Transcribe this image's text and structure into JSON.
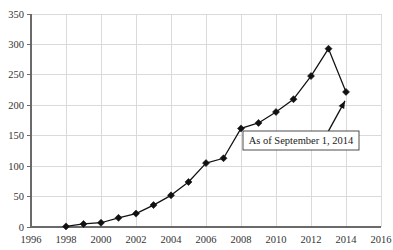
{
  "chart_data": {
    "type": "line",
    "title": "",
    "xlabel": "",
    "ylabel": "",
    "xlim": [
      1996,
      2016
    ],
    "ylim": [
      0,
      350
    ],
    "grid": true,
    "legend": "none",
    "marker": "filled-diamond",
    "line_color": "#111111",
    "grid_color": "#d6d6d6",
    "axis_color": "#6a6a6a",
    "x": [
      1998,
      1999,
      2000,
      2001,
      2002,
      2003,
      2004,
      2005,
      2006,
      2007,
      2008,
      2009,
      2010,
      2011,
      2012,
      2013,
      2014
    ],
    "values": [
      1,
      5,
      7,
      15,
      22,
      36,
      52,
      74,
      105,
      113,
      162,
      171,
      189,
      210,
      248,
      293,
      222
    ],
    "xticks": [
      1996,
      1998,
      2000,
      2002,
      2004,
      2006,
      2008,
      2010,
      2012,
      2014,
      2016
    ],
    "xticklabels": [
      "1996",
      "1998",
      "2000",
      "2002",
      "2004",
      "2006",
      "2008",
      "2010",
      "2012",
      "2014",
      "2016"
    ],
    "yticks": [
      0,
      50,
      100,
      150,
      200,
      250,
      300,
      350
    ],
    "yticklabels": [
      "0",
      "50",
      "100",
      "150",
      "200",
      "250",
      "300",
      "350"
    ],
    "annotations": [
      {
        "text": "As of September 1, 2014",
        "points_to_x": 2014,
        "points_to_y": 222
      }
    ]
  }
}
